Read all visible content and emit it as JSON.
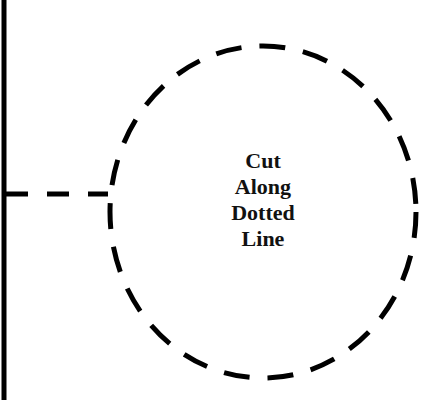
{
  "diagram": {
    "instruction_lines": [
      "Cut",
      "Along",
      "Dotted",
      "Line"
    ],
    "colors": {
      "stroke": "#000000",
      "text": "#111111",
      "background": "#ffffff"
    }
  }
}
